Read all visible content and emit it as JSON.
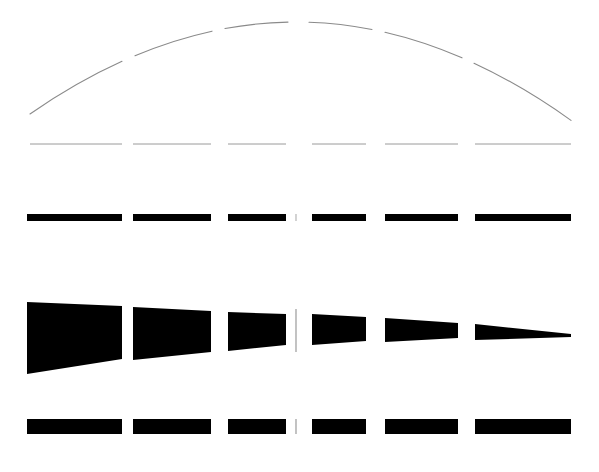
{
  "figure": {
    "width": 599,
    "height": 472,
    "background_color": "#ffffff",
    "ink_color": "#000000",
    "faint_color": "#8a8a8a",
    "center_axis_x": 296,
    "columns": [
      {
        "index": 1,
        "x_start": 27,
        "x_end": 122
      },
      {
        "index": 2,
        "x_start": 133,
        "x_end": 211
      },
      {
        "index": 3,
        "x_start": 228,
        "x_end": 286
      },
      {
        "index": 4,
        "x_start": 312,
        "x_end": 366
      },
      {
        "index": 5,
        "x_start": 385,
        "x_end": 458
      },
      {
        "index": 6,
        "x_start": 475,
        "x_end": 571
      }
    ],
    "rows": [
      {
        "name": "arc-row",
        "label": "dome-arc",
        "type": "arc",
        "stroke_color": "#8a8a8a",
        "stroke_width": 1.1,
        "apex_x": 296,
        "apex_y": 22,
        "left_end_x": 30,
        "left_end_y": 114,
        "right_end_x": 571,
        "right_end_y": 114,
        "segments": [
          {
            "x1": 30,
            "y1": 114,
            "x2": 122,
            "y2": 68
          },
          {
            "x1": 135,
            "y1": 62,
            "x2": 212,
            "y2": 38
          },
          {
            "x1": 225,
            "y1": 35,
            "x2": 288,
            "y2": 24
          },
          {
            "x1": 309,
            "y1": 24,
            "x2": 372,
            "y2": 35
          },
          {
            "x1": 385,
            "y1": 38,
            "x2": 462,
            "y2": 62
          },
          {
            "x1": 474,
            "y1": 68,
            "x2": 571,
            "y2": 114
          }
        ]
      },
      {
        "name": "thin-line-row",
        "label": "faint-baseline",
        "type": "line",
        "stroke_color": "#9a9a9a",
        "stroke_width": 1.0,
        "y": 144,
        "segments": [
          {
            "x1": 30,
            "x2": 122
          },
          {
            "x1": 133,
            "x2": 211
          },
          {
            "x1": 228,
            "x2": 286
          },
          {
            "x1": 312,
            "x2": 366
          },
          {
            "x1": 385,
            "x2": 458
          },
          {
            "x1": 475,
            "x2": 571
          }
        ]
      },
      {
        "name": "upper-bar-row",
        "label": "thin-black-bars",
        "type": "bars",
        "fill_color": "#000000",
        "y_top": 214,
        "thickness": 7,
        "segments": [
          {
            "x1": 27,
            "x2": 122
          },
          {
            "x1": 133,
            "x2": 211
          },
          {
            "x1": 228,
            "x2": 286
          },
          {
            "x1": 312,
            "x2": 366
          },
          {
            "x1": 385,
            "x2": 458
          },
          {
            "x1": 475,
            "x2": 571
          }
        ]
      },
      {
        "name": "wedge-row",
        "label": "tapering-wedges",
        "type": "wedges",
        "fill_color": "#000000",
        "comment": "Quadrilaterals whose vertical extent shrinks left-to-right, ending in a near point.",
        "segments": [
          {
            "x1": 27,
            "x2": 122,
            "y_top_left": 302,
            "y_bot_left": 374,
            "y_top_right": 306,
            "y_bot_right": 359
          },
          {
            "x1": 133,
            "x2": 211,
            "y_top_left": 307,
            "y_bot_left": 360,
            "y_top_right": 311,
            "y_bot_right": 352
          },
          {
            "x1": 228,
            "x2": 286,
            "y_top_left": 312,
            "y_bot_left": 351,
            "y_top_right": 314,
            "y_bot_right": 345
          },
          {
            "x1": 312,
            "x2": 366,
            "y_top_left": 314,
            "y_bot_left": 345,
            "y_top_right": 317,
            "y_bot_right": 341
          },
          {
            "x1": 385,
            "x2": 458,
            "y_top_left": 318,
            "y_bot_left": 342,
            "y_top_right": 323,
            "y_bot_right": 338
          },
          {
            "x1": 475,
            "x2": 571,
            "y_top_left": 324,
            "y_bot_left": 340,
            "y_top_right": 334,
            "y_bot_right": 337
          }
        ]
      },
      {
        "name": "lower-bar-row",
        "label": "thick-black-bars",
        "type": "bars",
        "fill_color": "#000000",
        "y_top": 419,
        "thickness": 15,
        "segments": [
          {
            "x1": 27,
            "x2": 122
          },
          {
            "x1": 133,
            "x2": 211
          },
          {
            "x1": 228,
            "x2": 286
          },
          {
            "x1": 312,
            "x2": 366
          },
          {
            "x1": 385,
            "x2": 458
          },
          {
            "x1": 475,
            "x2": 571
          }
        ]
      }
    ],
    "center_ticks": [
      {
        "name": "center-tick-upper-bar",
        "x": 296,
        "y1": 214,
        "y2": 221,
        "color": "#b5b5b5",
        "width": 1.2
      },
      {
        "name": "center-tick-wedge",
        "x": 296,
        "y1": 309,
        "y2": 352,
        "color": "#9a9a9a",
        "width": 1.2
      },
      {
        "name": "center-tick-lower-bar",
        "x": 296,
        "y1": 419,
        "y2": 434,
        "color": "#9a9a9a",
        "width": 1.2
      }
    ]
  }
}
